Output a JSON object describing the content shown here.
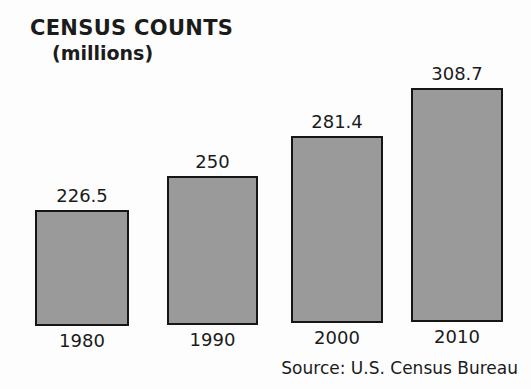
{
  "chart_data": {
    "type": "bar",
    "title": "CENSUS COUNTS",
    "subtitle": "(millions)",
    "categories": [
      "1980",
      "1990",
      "2000",
      "2010"
    ],
    "values": [
      226.5,
      250,
      281.4,
      308.7
    ],
    "value_labels": [
      "226.5",
      "250",
      "281.4",
      "308.7"
    ],
    "xlabel": "",
    "ylabel": "",
    "ylim": [
      0,
      330
    ],
    "grid": false,
    "legend": false,
    "source": "Source: U.S. Census Bureau",
    "bar_fill_color": "#9a9a9a",
    "bar_border_color": "#161616",
    "background_color": "#fdfdfd",
    "text_color": "#1b1b1b"
  },
  "layout": {
    "bars": [
      {
        "left": 35,
        "width": 94,
        "top": 210,
        "bottom": 326
      },
      {
        "left": 167,
        "width": 91,
        "top": 176,
        "bottom": 325
      },
      {
        "left": 291,
        "width": 92,
        "top": 136,
        "bottom": 323
      },
      {
        "left": 411,
        "width": 92,
        "top": 88,
        "bottom": 322
      }
    ],
    "value_label_offset": 25,
    "category_label_offset": 4
  }
}
